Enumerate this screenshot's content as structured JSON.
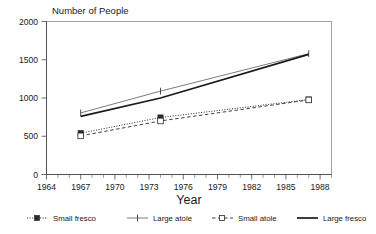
{
  "chart_data": {
    "type": "line",
    "title": "",
    "ylabel": "Number of People",
    "xlabel": "Year",
    "xlim": [
      1964,
      1989
    ],
    "ylim": [
      0,
      2000
    ],
    "yticks": [
      "0",
      "500",
      "1000",
      "1500",
      "2000"
    ],
    "ytick_values": [
      0,
      500,
      1000,
      1500,
      2000
    ],
    "xticks": [
      "1964",
      "1967",
      "1970",
      "1973",
      "1976",
      "1979",
      "1982",
      "1985",
      "1988"
    ],
    "xtick_values": [
      1964,
      1967,
      1970,
      1973,
      1976,
      1979,
      1982,
      1985,
      1988
    ],
    "grid": false,
    "legend_position": "bottom",
    "x": [
      1967,
      1974,
      1987
    ],
    "series": [
      {
        "name": "Small fresco",
        "values": [
          540,
          745,
          980
        ],
        "line_style": "dotted",
        "marker": "filled-square",
        "color": "#2b2b2b"
      },
      {
        "name": "Large atole",
        "values": [
          805,
          1090,
          1580
        ],
        "line_style": "solid-thin",
        "marker": "plus",
        "color": "#5a5a5a"
      },
      {
        "name": "Small atole",
        "values": [
          505,
          700,
          975
        ],
        "line_style": "dashed",
        "marker": "open-square",
        "color": "#2b2b2b"
      },
      {
        "name": "Large fresco",
        "values": [
          760,
          1000,
          1570
        ],
        "line_style": "solid-thick",
        "marker": "none",
        "color": "#1a1a1a"
      }
    ]
  },
  "legend": {
    "items": [
      {
        "label": "Small fresco"
      },
      {
        "label": "Large atole"
      },
      {
        "label": "Small atole"
      },
      {
        "label": "Large fresco"
      }
    ]
  }
}
